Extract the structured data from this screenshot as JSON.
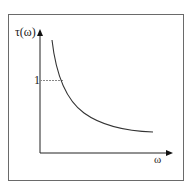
{
  "diagram": {
    "type": "line",
    "y_axis_label": "τ(ω)",
    "x_axis_label": "ω",
    "y_marker_label": "1",
    "curve": "decreasing convex curve (hyperbolic decay)",
    "reference_line": "dashed horizontal line from y-axis at level 1 to the curve",
    "colors": {
      "axes": "#222222",
      "curve": "#333333",
      "reference": "#888888",
      "frame": "#6a6a6a"
    }
  }
}
